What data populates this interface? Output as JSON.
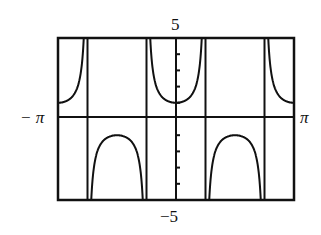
{
  "chart_data": {
    "type": "line",
    "title": "",
    "function": "y = sec(2x)",
    "xlabel": "",
    "ylabel": "",
    "xlim": [
      "-π",
      "π"
    ],
    "ylim": [
      -5,
      5
    ],
    "tick_labels": {
      "x_min": "−π",
      "x_max": "π",
      "y_max": "5",
      "y_min": "−5"
    },
    "asymptotes_x": [
      "-3π/4",
      "-π/4",
      "π/4",
      "3π/4"
    ],
    "y_ticks": [
      -5,
      -4,
      -3,
      -2,
      -1,
      1,
      2,
      3,
      4,
      5
    ],
    "grid": false,
    "series": [
      {
        "name": "sec(2x)",
        "color": "#111111"
      }
    ]
  },
  "labels": {
    "top": "5",
    "bottom": "−5",
    "left": "− π",
    "right": "π"
  }
}
